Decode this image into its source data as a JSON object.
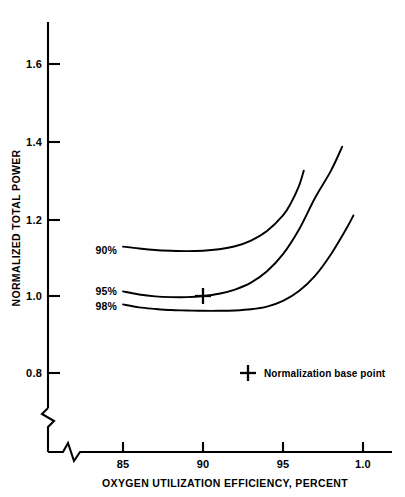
{
  "chart_data": {
    "type": "line",
    "title": "",
    "xlabel": "OXYGEN UTILIZATION EFFICIENCY, PERCENT",
    "ylabel": "NORMALIZED TOTAL POWER",
    "xlim": [
      83.5,
      101.5
    ],
    "ylim": [
      0.74,
      1.68
    ],
    "grid": false,
    "axis_break_x": true,
    "axis_break_y": true,
    "xticks": [
      {
        "value": 85,
        "label": "85"
      },
      {
        "value": 90,
        "label": "90"
      },
      {
        "value": 95,
        "label": "95"
      },
      {
        "value": 100,
        "label": "1.0"
      }
    ],
    "yticks": [
      {
        "value": 0.8,
        "label": "0.8"
      },
      {
        "value": 1.0,
        "label": "1.0"
      },
      {
        "value": 1.2,
        "label": "1.2"
      },
      {
        "value": 1.4,
        "label": "1.4"
      },
      {
        "value": 1.6,
        "label": "1.6"
      }
    ],
    "legend_position": "inside-lower-right",
    "annotations": [
      {
        "name": "normalization-base-point",
        "label": "Normalization base point",
        "marker": "plus",
        "x": 90.0,
        "y": 1.0
      }
    ],
    "series": [
      {
        "name": "90%",
        "label": "90%",
        "label_position": "left-of-curve-start",
        "points": [
          [
            85.0,
            1.13
          ],
          [
            86.0,
            1.125
          ],
          [
            87.0,
            1.121
          ],
          [
            88.0,
            1.119
          ],
          [
            89.0,
            1.118
          ],
          [
            90.0,
            1.119
          ],
          [
            91.0,
            1.123
          ],
          [
            92.0,
            1.131
          ],
          [
            93.0,
            1.146
          ],
          [
            94.0,
            1.171
          ],
          [
            95.0,
            1.212
          ],
          [
            95.5,
            1.245
          ],
          [
            96.0,
            1.29
          ],
          [
            96.3,
            1.33
          ]
        ]
      },
      {
        "name": "95%",
        "label": "95%",
        "label_position": "left-of-curve-start",
        "points": [
          [
            85.0,
            1.012
          ],
          [
            86.0,
            1.004
          ],
          [
            87.0,
            0.999
          ],
          [
            88.0,
            0.997
          ],
          [
            89.0,
            0.997
          ],
          [
            90.0,
            1.0
          ],
          [
            91.0,
            1.006
          ],
          [
            92.0,
            1.017
          ],
          [
            93.0,
            1.035
          ],
          [
            94.0,
            1.065
          ],
          [
            95.0,
            1.11
          ],
          [
            96.0,
            1.175
          ],
          [
            97.0,
            1.258
          ],
          [
            98.0,
            1.33
          ],
          [
            98.7,
            1.393
          ]
        ]
      },
      {
        "name": "98%",
        "label": "98%",
        "label_position": "left-of-curve-start",
        "points": [
          [
            85.0,
            0.978
          ],
          [
            86.0,
            0.97
          ],
          [
            87.0,
            0.966
          ],
          [
            88.0,
            0.963
          ],
          [
            89.0,
            0.962
          ],
          [
            90.0,
            0.961
          ],
          [
            91.0,
            0.961
          ],
          [
            92.0,
            0.962
          ],
          [
            93.0,
            0.965
          ],
          [
            94.0,
            0.972
          ],
          [
            95.0,
            0.987
          ],
          [
            96.0,
            1.013
          ],
          [
            97.0,
            1.053
          ],
          [
            98.0,
            1.11
          ],
          [
            99.0,
            1.18
          ],
          [
            99.4,
            1.212
          ]
        ]
      }
    ]
  },
  "axis": {
    "x_title": "OXYGEN UTILIZATION EFFICIENCY, PERCENT",
    "y_title": "NORMALIZED TOTAL POWER"
  },
  "legend": {
    "base_point_label": "Normalization base point"
  },
  "series_labels": {
    "s0": "90%",
    "s1": "95%",
    "s2": "98%"
  },
  "xtick_labels": {
    "t0": "85",
    "t1": "90",
    "t2": "95",
    "t3": "1.0"
  },
  "ytick_labels": {
    "t0": "1.6",
    "t1": "1.4",
    "t2": "1.2",
    "t3": "1.0",
    "t4": "0.8"
  },
  "colors": {
    "ink": "#000000",
    "paper": "#ffffff"
  }
}
